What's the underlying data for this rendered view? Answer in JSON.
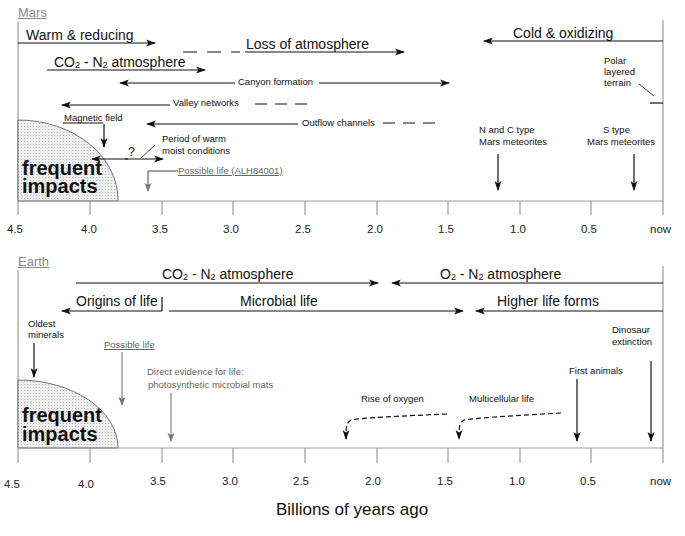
{
  "mars": {
    "title": "Mars",
    "labels": {
      "warm_reducing": "Warm & reducing",
      "loss_atmosphere": "Loss of atmosphere",
      "cold_oxidizing": "Cold  & oxidizing",
      "co2_prefix": "CO",
      "co2_sub": "2",
      "co2_mid": " - N",
      "co2_sub2": "2",
      "co2_suffix": " atmosphere",
      "canyon": "Canyon formation",
      "valley": "Valley networks",
      "outflow": "Outflow channels",
      "magnetic": "Magnetic field",
      "warm_moist_1": "Period of warm",
      "warm_moist_2": "moist conditions",
      "question": "?",
      "possible_life": "Possible life (ALH84001)",
      "polar_1": "Polar",
      "polar_2": "layered",
      "polar_3": "terrain",
      "nc_type_1": "N and C type",
      "nc_type_2": "Mars meteorites",
      "s_type_1": "S type",
      "s_type_2": "Mars meteorites",
      "impacts_1": "frequent",
      "impacts_2": "impacts"
    }
  },
  "earth": {
    "title": "Earth",
    "labels": {
      "co2_prefix": "CO",
      "co2_sub": "2",
      "co2_mid": " - N",
      "co2_sub2": "2",
      "co2_suffix": " atmosphere",
      "o2_prefix": "O",
      "o2_sub": "2",
      "o2_mid": " - N",
      "o2_sub2": "2",
      "o2_suffix": "  atmosphere",
      "origins": "Origins of life",
      "microbial": "Microbial life",
      "higher": "Higher life forms",
      "oldest_1": "Oldest",
      "oldest_2": "minerals",
      "possible_life": "Possible life",
      "direct_1": "Direct evidence for life:",
      "direct_2": "photosynthetic microbial mats",
      "rise_oxygen": "Rise of oxygen",
      "multicellular": "Multicellular life",
      "first_animals": "First animals",
      "dino_1": "Dinosaur",
      "dino_2": "extinction",
      "impacts_1": "frequent",
      "impacts_2": "impacts"
    }
  },
  "axis": {
    "ticks": [
      "4.5",
      "4.0",
      "3.5",
      "3.0",
      "2.5",
      "2.0",
      "1.5",
      "1.0",
      "0.5",
      "now"
    ],
    "xlabel": "Billions of years ago"
  },
  "colors": {
    "line": "#111111",
    "axis": "#999999",
    "gray_text": "#666666",
    "impact_fill": "#e4e4e4"
  }
}
